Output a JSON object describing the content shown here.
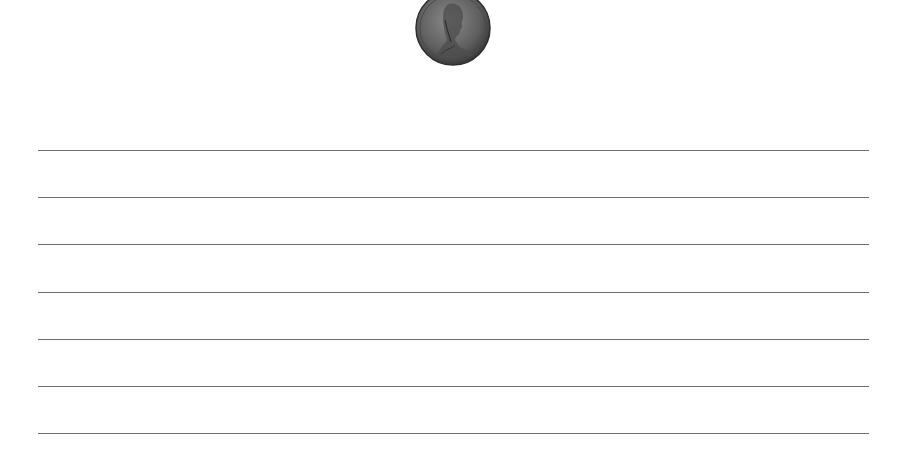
{
  "worksheet": {
    "image": {
      "icon": "penny-coin-icon",
      "label": "One cent coin (Lincoln penny)"
    },
    "writing_lines": {
      "count": 7,
      "color": "#6e6e6e",
      "y_positions": [
        150,
        197,
        244,
        292,
        339,
        386,
        433
      ]
    }
  }
}
